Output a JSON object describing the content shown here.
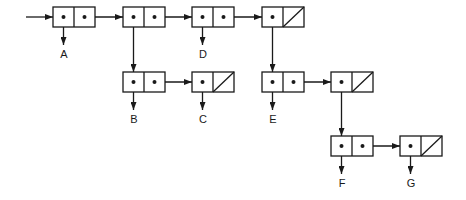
{
  "diagram": {
    "type": "box-and-pointer",
    "colors": {
      "stroke": "#1a1a1a",
      "background": "#ffffff"
    },
    "cell_size": {
      "w": 21,
      "h": 20
    },
    "pairs": [
      {
        "id": "p1",
        "x": 53,
        "y": 7,
        "car": "A",
        "cdr": "p2"
      },
      {
        "id": "p2",
        "x": 123,
        "y": 7,
        "car": "p5",
        "cdr": "p3"
      },
      {
        "id": "p3",
        "x": 192,
        "y": 7,
        "car": "D",
        "cdr": "p4"
      },
      {
        "id": "p4",
        "x": 262,
        "y": 7,
        "car": "p7",
        "cdr": null
      },
      {
        "id": "p5",
        "x": 123,
        "y": 72,
        "car": "B",
        "cdr": "p6"
      },
      {
        "id": "p6",
        "x": 192,
        "y": 72,
        "car": "C",
        "cdr": null
      },
      {
        "id": "p7",
        "x": 262,
        "y": 72,
        "car": "E",
        "cdr": "p8"
      },
      {
        "id": "p8",
        "x": 331,
        "y": 72,
        "car": "p9",
        "cdr": null
      },
      {
        "id": "p9",
        "x": 331,
        "y": 136,
        "car": "F",
        "cdr": "p10"
      },
      {
        "id": "p10",
        "x": 400,
        "y": 136,
        "car": "G",
        "cdr": null
      }
    ],
    "labels": [
      {
        "text": "A",
        "x": 64,
        "y": 58
      },
      {
        "text": "D",
        "x": 203,
        "y": 58
      },
      {
        "text": "B",
        "x": 134,
        "y": 123
      },
      {
        "text": "C",
        "x": 203,
        "y": 123
      },
      {
        "text": "E",
        "x": 273,
        "y": 123
      },
      {
        "text": "F",
        "x": 342,
        "y": 187
      },
      {
        "text": "G",
        "x": 411,
        "y": 187
      }
    ],
    "entry_arrow": {
      "from": [
        26,
        17
      ],
      "to": [
        53,
        17
      ]
    }
  }
}
